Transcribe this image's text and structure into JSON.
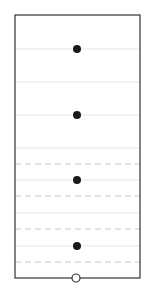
{
  "chart_data": {
    "type": "scatter",
    "title": "",
    "xlabel": "",
    "ylabel": "",
    "frame": {
      "left": 15,
      "top": 15,
      "right": 140,
      "bottom": 278
    },
    "solid_gridlines_y": [
      49,
      82,
      115,
      148,
      180,
      213,
      246
    ],
    "dashed_gridlines_y": [
      164,
      196,
      229,
      262
    ],
    "points": [
      {
        "x": 77,
        "y": 49,
        "style": "filled"
      },
      {
        "x": 77,
        "y": 115,
        "style": "filled"
      },
      {
        "x": 77,
        "y": 180,
        "style": "filled"
      },
      {
        "x": 77,
        "y": 246,
        "style": "filled"
      },
      {
        "x": 76,
        "y": 278,
        "style": "open"
      }
    ],
    "colors": {
      "frame": "#333333",
      "grid": "#e6e6e6",
      "dashed": "#c8c8c8",
      "point": "#1a1a1a"
    },
    "grid": true,
    "legend": null
  }
}
